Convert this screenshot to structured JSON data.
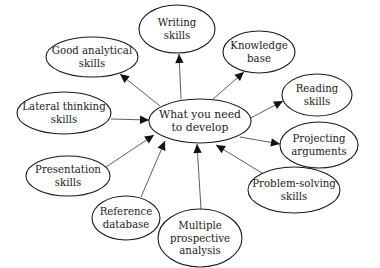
{
  "diagram": {
    "type": "mind-map",
    "center": {
      "id": "center",
      "lines": [
        "What you need",
        "to develop"
      ],
      "cx": 200,
      "cy": 121,
      "rx": 51,
      "ry": 22
    },
    "nodes": [
      {
        "id": "writing",
        "lines": [
          "Writing",
          "skills"
        ],
        "cx": 177,
        "cy": 29,
        "rx": 38,
        "ry": 24,
        "from": [
          181,
          99
        ],
        "to": [
          179,
          54
        ]
      },
      {
        "id": "analytical",
        "lines": [
          "Good analytical",
          "skills"
        ],
        "cx": 92,
        "cy": 57,
        "rx": 46,
        "ry": 20,
        "from": [
          160,
          106
        ],
        "to": [
          120,
          74
        ]
      },
      {
        "id": "knowledge",
        "lines": [
          "Knowledge",
          "base"
        ],
        "cx": 259,
        "cy": 52,
        "rx": 36,
        "ry": 21,
        "from": [
          212,
          100
        ],
        "to": [
          244,
          72
        ]
      },
      {
        "id": "reading",
        "lines": [
          "Reading",
          "skills"
        ],
        "cx": 317,
        "cy": 95,
        "rx": 35,
        "ry": 21,
        "from": [
          243,
          122
        ],
        "to": [
          283,
          101
        ]
      },
      {
        "id": "lateral",
        "lines": [
          "Lateral thinking",
          "skills"
        ],
        "cx": 64,
        "cy": 113,
        "rx": 47,
        "ry": 21,
        "from": [
          111,
          119
        ],
        "to": [
          149,
          120
        ]
      },
      {
        "id": "projecting",
        "lines": [
          "Projecting",
          "arguments"
        ],
        "cx": 319,
        "cy": 145,
        "rx": 39,
        "ry": 23,
        "from": [
          240,
          137
        ],
        "to": [
          280,
          144
        ]
      },
      {
        "id": "presentation",
        "lines": [
          "Presentation",
          "skills"
        ],
        "cx": 68,
        "cy": 176,
        "rx": 42,
        "ry": 20,
        "from": [
          106,
          167
        ],
        "to": [
          154,
          135
        ]
      },
      {
        "id": "problem",
        "lines": [
          "Problem-solving",
          "skills"
        ],
        "cx": 294,
        "cy": 190,
        "rx": 46,
        "ry": 23,
        "from": [
          262,
          173
        ],
        "to": [
          216,
          145
        ]
      },
      {
        "id": "reference",
        "lines": [
          "Reference",
          "database"
        ],
        "cx": 126,
        "cy": 218,
        "rx": 34,
        "ry": 22,
        "from": [
          141,
          197
        ],
        "to": [
          165,
          141
        ]
      },
      {
        "id": "multiple",
        "lines": [
          "Multiple",
          "prospective",
          "analysis"
        ],
        "cx": 200,
        "cy": 238,
        "rx": 42,
        "ry": 29,
        "from": [
          201,
          209
        ],
        "to": [
          197,
          144
        ]
      }
    ],
    "edge_direction": "all arrows point from center to node, except Lateral thinking, Presentation, Reference database, Multiple prospective analysis and Problem-solving which point into the center"
  },
  "arrows": [
    {
      "id": "writing",
      "head_at": "node"
    },
    {
      "id": "analytical",
      "head_at": "node"
    },
    {
      "id": "knowledge",
      "head_at": "node"
    },
    {
      "id": "reading",
      "head_at": "node"
    },
    {
      "id": "lateral",
      "head_at": "center"
    },
    {
      "id": "projecting",
      "head_at": "node"
    },
    {
      "id": "presentation",
      "head_at": "center"
    },
    {
      "id": "problem",
      "head_at": "center"
    },
    {
      "id": "reference",
      "head_at": "center"
    },
    {
      "id": "multiple",
      "head_at": "center"
    }
  ],
  "colors": {
    "background": "#ffffff",
    "stroke": "#1a1a1a",
    "text": "#222222",
    "arrow": "#111111"
  }
}
